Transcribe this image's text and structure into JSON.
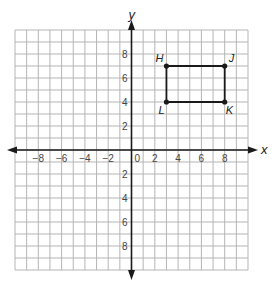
{
  "chart_data": {
    "type": "coordinate-plane",
    "title": "",
    "xlabel": "x",
    "ylabel": "y",
    "xlim": [
      -10,
      10
    ],
    "ylim": [
      -10,
      10
    ],
    "grid": true,
    "x_tick_labels": [
      "-8",
      "-6",
      "-4",
      "-2",
      "0",
      "2",
      "4",
      "6",
      "8"
    ],
    "y_tick_labels": [
      "8",
      "6",
      "4",
      "2",
      "2",
      "4",
      "6",
      "8"
    ],
    "points": [
      {
        "name": "H",
        "x": 3,
        "y": 7
      },
      {
        "name": "J",
        "x": 8,
        "y": 7
      },
      {
        "name": "K",
        "x": 8,
        "y": 4
      },
      {
        "name": "L",
        "x": 3,
        "y": 4
      }
    ],
    "polygon": [
      "H",
      "J",
      "K",
      "L"
    ]
  },
  "colors": {
    "grid": "#b5b5b5",
    "axis": "#1a1a1a",
    "shape": "#1a1a1a"
  }
}
